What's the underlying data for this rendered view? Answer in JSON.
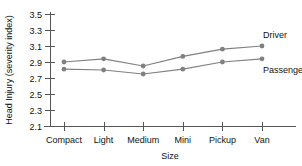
{
  "chart_data": {
    "type": "line",
    "title": "",
    "xlabel": "Size",
    "ylabel": "Head Injury (severity index)",
    "categories": [
      "Compact",
      "Light",
      "Medium",
      "Mini",
      "Pickup",
      "Van"
    ],
    "yticks": [
      "2.1",
      "2.3",
      "2.5",
      "2.7",
      "2.9",
      "3.1",
      "3.3",
      "3.5"
    ],
    "ylim": [
      2.1,
      3.5
    ],
    "grid": false,
    "legend_position": "inline-right",
    "series": [
      {
        "name": "Driver",
        "values": [
          2.9,
          2.94,
          2.85,
          2.97,
          3.06,
          3.1
        ],
        "color": "#808080",
        "label": "Driver"
      },
      {
        "name": "Passenger",
        "values": [
          2.81,
          2.8,
          2.75,
          2.81,
          2.9,
          2.94
        ],
        "color": "#808080",
        "label": "Passenger"
      }
    ]
  }
}
